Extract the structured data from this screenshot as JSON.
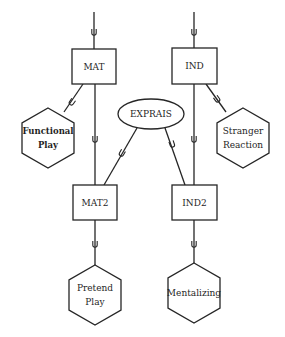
{
  "diagram": {
    "type": "structural-equation-path-diagram",
    "colors": {
      "stroke": "#262626",
      "text": "#1f1f1f",
      "background": "#ffffff"
    },
    "latent_boxes": [
      {
        "id": "MAT",
        "label": "MAT",
        "x": 72,
        "y": 49,
        "w": 44,
        "h": 35
      },
      {
        "id": "IND",
        "label": "IND",
        "x": 172,
        "y": 48,
        "w": 45,
        "h": 36
      },
      {
        "id": "MAT2",
        "label": "MAT2",
        "x": 73,
        "y": 185,
        "w": 44,
        "h": 35
      },
      {
        "id": "IND2",
        "label": "IND2",
        "x": 172,
        "y": 185,
        "w": 45,
        "h": 35
      }
    ],
    "ellipses": [
      {
        "id": "EXPRAIS",
        "label": "EXPRAIS",
        "cx": 151,
        "cy": 114,
        "rx": 33,
        "ry": 15
      }
    ],
    "hexagons": [
      {
        "id": "functional-play",
        "lines": [
          "Functional",
          "Play"
        ],
        "cx": 48,
        "cy": 138,
        "r": 30,
        "bold": true
      },
      {
        "id": "stranger-reaction",
        "lines": [
          "Stranger",
          "Reaction"
        ],
        "cx": 243,
        "cy": 138,
        "r": 30,
        "bold": false
      },
      {
        "id": "pretend-play",
        "lines": [
          "Pretend",
          "Play"
        ],
        "cx": 95,
        "cy": 295,
        "r": 30,
        "bold": false
      },
      {
        "id": "mentalizing",
        "lines": [
          "Mentalizing"
        ],
        "cx": 194,
        "cy": 293,
        "r": 30,
        "bold": false
      }
    ],
    "edges": [
      {
        "from": "top-in-MAT",
        "x1": 94,
        "y1": 12,
        "x2": 94,
        "y2": 49,
        "hook": [
          94,
          32
        ]
      },
      {
        "from": "top-in-IND",
        "x1": 194,
        "y1": 12,
        "x2": 194,
        "y2": 48,
        "hook": [
          194,
          32
        ]
      },
      {
        "from": "MAT-MAT2",
        "x1": 95,
        "y1": 84,
        "x2": 95,
        "y2": 185,
        "hook": [
          95,
          139
        ]
      },
      {
        "from": "IND-IND2",
        "x1": 194,
        "y1": 84,
        "x2": 194,
        "y2": 185,
        "hook": [
          194,
          139
        ]
      },
      {
        "from": "MAT-FP",
        "x1": 83,
        "y1": 84,
        "x2": 64,
        "y2": 112,
        "hook": [
          72,
          102
        ]
      },
      {
        "from": "IND-SR",
        "x1": 206,
        "y1": 84,
        "x2": 226,
        "y2": 112,
        "hook": [
          217,
          99
        ]
      },
      {
        "from": "EXP-MAT2",
        "x1": 137,
        "y1": 128,
        "x2": 104,
        "y2": 185,
        "hook": [
          122,
          153
        ]
      },
      {
        "from": "EXP-IND2",
        "x1": 165,
        "y1": 128,
        "x2": 185,
        "y2": 185,
        "hook": [
          172,
          144
        ]
      },
      {
        "from": "MAT2-PP",
        "x1": 95,
        "y1": 220,
        "x2": 95,
        "y2": 265,
        "hook": [
          95,
          244
        ]
      },
      {
        "from": "IND2-MENT",
        "x1": 194,
        "y1": 220,
        "x2": 194,
        "y2": 263,
        "hook": [
          194,
          244
        ]
      }
    ]
  }
}
